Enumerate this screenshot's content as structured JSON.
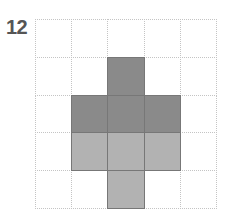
{
  "figure": {
    "label": "12",
    "grid": {
      "rows": 5,
      "cols": 5
    },
    "shaded_cells": [
      {
        "row": 1,
        "col": 2,
        "shade": "dark"
      },
      {
        "row": 2,
        "col": 1,
        "shade": "dark"
      },
      {
        "row": 2,
        "col": 2,
        "shade": "dark"
      },
      {
        "row": 2,
        "col": 3,
        "shade": "dark"
      },
      {
        "row": 3,
        "col": 1,
        "shade": "light"
      },
      {
        "row": 3,
        "col": 2,
        "shade": "light"
      },
      {
        "row": 3,
        "col": 3,
        "shade": "light"
      },
      {
        "row": 4,
        "col": 2,
        "shade": "light"
      }
    ],
    "colors": {
      "dark": "#8a8a8a",
      "light": "#b2b2b2",
      "grid_line": "#c4c4c4"
    }
  }
}
